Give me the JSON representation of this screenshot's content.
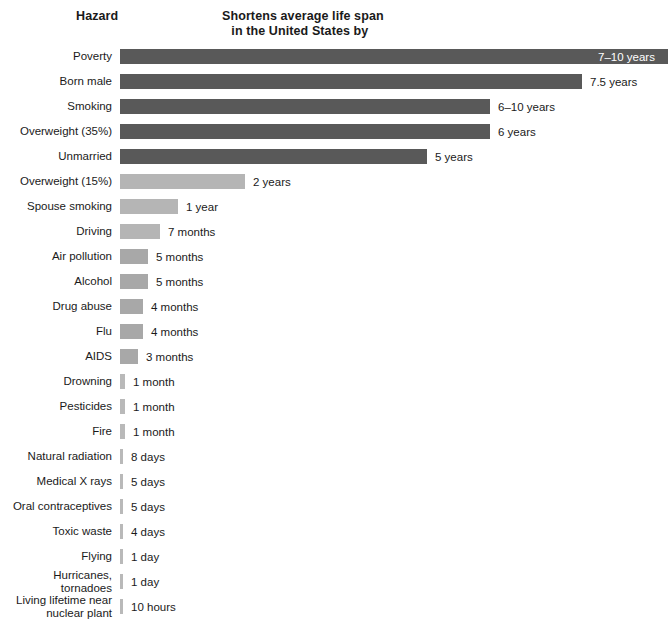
{
  "header": {
    "hazard_label": "Hazard",
    "metric_label_line1": "Shortens average life span",
    "metric_label_line2": "in the United States by"
  },
  "colors": {
    "bar_dark": "#595959",
    "bar_light": "#b5b5b5",
    "bar_sliver": "#b9b9b9",
    "text": "#1a1a1a",
    "inside_label": "#ffffff",
    "background": "#ffffff"
  },
  "chart_data": {
    "type": "bar",
    "orientation": "horizontal",
    "title": "",
    "subtitle": "",
    "xlabel": "Shortens average life span in the United States by",
    "ylabel": "Hazard",
    "grid": false,
    "legend": null,
    "axis_visible": false,
    "unit": "days (life span reduction)",
    "categories": [
      "Poverty",
      "Born male",
      "Smoking",
      "Overweight (35%)",
      "Unmarried",
      "Overweight (15%)",
      "Spouse smoking",
      "Driving",
      "Air pollution",
      "Alcohol",
      "Drug abuse",
      "Flu",
      "AIDS",
      "Drowning",
      "Pesticides",
      "Fire",
      "Natural radiation",
      "Medical X rays",
      "Oral contraceptives",
      "Toxic waste",
      "Flying",
      "Hurricanes, tornadoes",
      "Living lifetime near nuclear plant"
    ],
    "value_labels": [
      "7–10 years",
      "7.5 years",
      "6–10 years",
      "6 years",
      "5 years",
      "2 years",
      "1 year",
      "7 months",
      "5 months",
      "5 months",
      "4 months",
      "4 months",
      "3 months",
      "1 month",
      "1 month",
      "1 month",
      "8 days",
      "5 days",
      "5 days",
      "4 days",
      "1 day",
      "1 day",
      "10 hours"
    ],
    "values_days": [
      3103,
      2738,
      2921,
      2191,
      1826,
      730,
      365,
      213,
      152,
      152,
      122,
      122,
      91,
      30,
      30,
      30,
      8,
      5,
      5,
      4,
      1,
      1,
      0.42
    ],
    "rows": [
      {
        "label": "Poverty",
        "value_label": "7–10 years",
        "bar_px": 548,
        "shade": "dark",
        "label_inside": true
      },
      {
        "label": "Born male",
        "value_label": "7.5 years",
        "bar_px": 462,
        "shade": "dark",
        "label_inside": false
      },
      {
        "label": "Smoking",
        "value_label": "6–10 years",
        "bar_px": 370,
        "shade": "dark",
        "label_inside": false
      },
      {
        "label": "Overweight (35%)",
        "value_label": "6 years",
        "bar_px": 370,
        "shade": "dark",
        "label_inside": false
      },
      {
        "label": "Unmarried",
        "value_label": "5 years",
        "bar_px": 307,
        "shade": "dark",
        "label_inside": false
      },
      {
        "label": "Overweight (15%)",
        "value_label": "2 years",
        "bar_px": 125,
        "shade": "light",
        "label_inside": false
      },
      {
        "label": "Spouse smoking",
        "value_label": "1 year",
        "bar_px": 58,
        "shade": "light",
        "label_inside": false
      },
      {
        "label": "Driving",
        "value_label": "7 months",
        "bar_px": 40,
        "shade": "light",
        "label_inside": false
      },
      {
        "label": "Air pollution",
        "value_label": "5 months",
        "bar_px": 28,
        "shade": "mid",
        "label_inside": false
      },
      {
        "label": "Alcohol",
        "value_label": "5 months",
        "bar_px": 28,
        "shade": "mid",
        "label_inside": false
      },
      {
        "label": "Drug abuse",
        "value_label": "4 months",
        "bar_px": 23,
        "shade": "mid",
        "label_inside": false
      },
      {
        "label": "Flu",
        "value_label": "4 months",
        "bar_px": 23,
        "shade": "mid",
        "label_inside": false
      },
      {
        "label": "AIDS",
        "value_label": "3 months",
        "bar_px": 18,
        "shade": "mid",
        "label_inside": false
      },
      {
        "label": "Drowning",
        "value_label": "1 month",
        "bar_px": 5,
        "shade": "sliver",
        "label_inside": false
      },
      {
        "label": "Pesticides",
        "value_label": "1 month",
        "bar_px": 5,
        "shade": "sliver",
        "label_inside": false
      },
      {
        "label": "Fire",
        "value_label": "1 month",
        "bar_px": 5,
        "shade": "sliver",
        "label_inside": false
      },
      {
        "label": "Natural radiation",
        "value_label": "8 days",
        "bar_px": 3,
        "shade": "sliver",
        "label_inside": false
      },
      {
        "label": "Medical X rays",
        "value_label": "5 days",
        "bar_px": 3,
        "shade": "sliver",
        "label_inside": false
      },
      {
        "label": "Oral contraceptives",
        "value_label": "5 days",
        "bar_px": 3,
        "shade": "sliver",
        "label_inside": false
      },
      {
        "label": "Toxic waste",
        "value_label": "4 days",
        "bar_px": 3,
        "shade": "sliver",
        "label_inside": false
      },
      {
        "label": "Flying",
        "value_label": "1 day",
        "bar_px": 3,
        "shade": "sliver",
        "label_inside": false
      },
      {
        "label": "Hurricanes, tornadoes",
        "value_label": "1 day",
        "bar_px": 3,
        "shade": "sliver",
        "label_inside": false
      },
      {
        "label": "Living lifetime near\nnuclear plant",
        "value_label": "10 hours",
        "bar_px": 3,
        "shade": "sliver",
        "label_inside": false
      }
    ]
  }
}
